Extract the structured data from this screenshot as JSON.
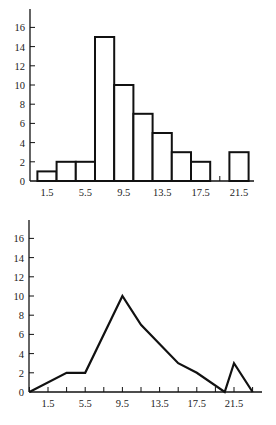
{
  "chart_data": [
    {
      "type": "bar",
      "subtype": "histogram",
      "title": "",
      "xlabel": "",
      "ylabel": "",
      "bin_width": 2,
      "bin_edges": [
        0.5,
        2.5,
        4.5,
        6.5,
        8.5,
        10.5,
        12.5,
        14.5,
        16.5,
        18.5,
        20.5,
        22.5
      ],
      "categories": [
        "1.5",
        "3.5",
        "5.5",
        "7.5",
        "9.5",
        "11.5",
        "13.5",
        "15.5",
        "17.5",
        "19.5",
        "21.5"
      ],
      "values": [
        1,
        2,
        2,
        15,
        10,
        7,
        5,
        3,
        2,
        0,
        3
      ],
      "x_tick_labels": [
        "1.5",
        "5.5",
        "9.5",
        "13.5",
        "17.5",
        "21.5"
      ],
      "y_tick_labels": [
        "0",
        "2",
        "4",
        "6",
        "8",
        "10",
        "12",
        "14",
        "16"
      ],
      "ylim": [
        0,
        17.5
      ],
      "xlim": [
        -0.5,
        24
      ],
      "grid": false,
      "legend": null
    },
    {
      "type": "line",
      "subtype": "frequency polygon",
      "title": "",
      "xlabel": "",
      "ylabel": "",
      "x": [
        -0.5,
        3.5,
        5.5,
        9.5,
        11.5,
        13.5,
        15.5,
        17.5,
        20.5,
        21.5,
        23.5
      ],
      "values": [
        0,
        2,
        2,
        10,
        7,
        5,
        3,
        2,
        0,
        3,
        0
      ],
      "x_tick_labels": [
        "1.5",
        "5.5",
        "9.5",
        "13.5",
        "17.5",
        "21.5"
      ],
      "y_tick_labels": [
        "0",
        "2",
        "4",
        "6",
        "8",
        "10",
        "12",
        "14",
        "16"
      ],
      "ylim": [
        0,
        17.5
      ],
      "xlim": [
        -0.5,
        25
      ],
      "grid": false,
      "legend": null
    }
  ]
}
